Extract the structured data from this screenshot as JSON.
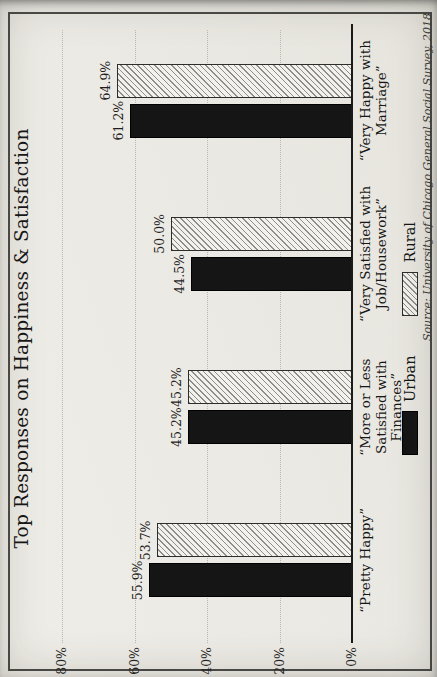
{
  "chart_data": {
    "type": "bar",
    "title": "Top Responses on Happiness & Satisfaction",
    "categories": [
      {
        "label": "“Pretty Happy”",
        "lines": [
          "“Pretty Happy”"
        ]
      },
      {
        "label": "“More or Less Satisfied with Finances”",
        "lines": [
          "“More or Less",
          "Satisfied with",
          "Finances”"
        ]
      },
      {
        "label": "“Very Satisfied with Job/Housework”",
        "lines": [
          "“Very Satisfied with",
          "Job/Housework”"
        ]
      },
      {
        "label": "“Very Happy with Marriage”",
        "lines": [
          "“Very Happy with",
          "Marriage”"
        ]
      }
    ],
    "series": [
      {
        "name": "Urban",
        "style": "solid-black",
        "values": [
          55.9,
          45.2,
          44.5,
          61.2
        ],
        "labels": [
          "55.9%",
          "45.2%",
          "44.5%",
          "61.2%"
        ]
      },
      {
        "name": "Rural",
        "style": "diagonal-hatch",
        "values": [
          53.7,
          45.2,
          50.0,
          64.9
        ],
        "labels": [
          "53.7%",
          "45.2%",
          "50.0%",
          "64.9%"
        ]
      }
    ],
    "ylim": [
      0,
      80
    ],
    "yticks": [
      {
        "value": 0,
        "label": "0%"
      },
      {
        "value": 20,
        "label": "20%"
      },
      {
        "value": 40,
        "label": "40%"
      },
      {
        "value": 60,
        "label": "60%"
      },
      {
        "value": 80,
        "label": "80%"
      }
    ],
    "grid": "dotted horizontal gridlines at 20% intervals",
    "legend_position": "bottom-center",
    "source": "Source: University of Chicago General Social Survey, 2018",
    "layout_hint": "landscape chart photographed and rotated 90° counter-clockwise into portrait",
    "colors": {
      "urban_bar": "#151515",
      "hatch_line": "#8d8d8a",
      "paper": "#ebe9e3",
      "gridline": "#b9b8b2",
      "axis": "#1a1a1a",
      "frame": "#4a4a47"
    }
  }
}
